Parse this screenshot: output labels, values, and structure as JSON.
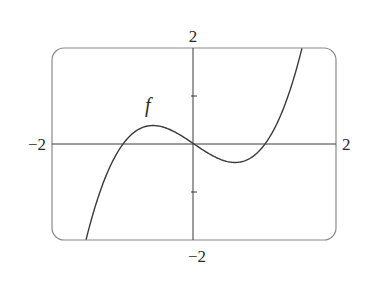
{
  "chart_data": {
    "type": "line",
    "title": "",
    "xlabel": "",
    "ylabel": "",
    "xlim": [
      -2,
      2
    ],
    "ylim": [
      -2,
      2
    ],
    "grid": false,
    "legend": null,
    "annotations": [
      {
        "text": "f",
        "x": -0.6,
        "y": 0.8,
        "italic": true
      }
    ],
    "axis_labels": {
      "x_min": "−2",
      "x_max": "2",
      "y_min": "−2",
      "y_max": "2"
    },
    "y_ticks": [
      -1,
      1
    ],
    "x_ticks": [],
    "series": [
      {
        "name": "f",
        "function": "x^3 - x",
        "x": [
          -1.52,
          -1.4,
          -1.2,
          -1.0,
          -0.8,
          -0.577,
          -0.4,
          -0.2,
          0.0,
          0.2,
          0.4,
          0.577,
          0.8,
          1.0,
          1.2,
          1.4,
          1.52
        ],
        "values": [
          -1.99,
          -1.34,
          -0.53,
          0.0,
          0.29,
          0.385,
          0.34,
          0.19,
          0.0,
          -0.19,
          -0.34,
          -0.385,
          -0.29,
          0.0,
          0.53,
          1.34,
          1.99
        ],
        "roots": [
          -1,
          0,
          1
        ],
        "local_max": [
          -0.577,
          0.385
        ],
        "local_min": [
          0.577,
          -0.385
        ]
      }
    ],
    "colors": {
      "curve": "#3a3a3a",
      "axes": "#3a3a3a",
      "frame": "#8a8a8a"
    }
  }
}
